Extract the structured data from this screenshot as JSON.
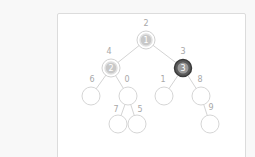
{
  "tree": {
    "nodes": [
      {
        "id": "root",
        "x": 146,
        "y": 40,
        "label": "2",
        "value": "1",
        "state": "visited"
      },
      {
        "id": "left",
        "x": 111,
        "y": 68,
        "label": "4",
        "value": "2",
        "state": "visited"
      },
      {
        "id": "right",
        "x": 183,
        "y": 68,
        "label": "3",
        "value": "3",
        "state": "current"
      },
      {
        "id": "ll",
        "x": 91,
        "y": 96,
        "label": "6",
        "value": "",
        "state": "empty"
      },
      {
        "id": "lr",
        "x": 128,
        "y": 96,
        "label": "0",
        "value": "",
        "state": "empty"
      },
      {
        "id": "rl",
        "x": 164,
        "y": 96,
        "label": "1",
        "value": "",
        "state": "empty"
      },
      {
        "id": "rr",
        "x": 201,
        "y": 96,
        "label": "8",
        "value": "",
        "state": "empty"
      },
      {
        "id": "lrl",
        "x": 118,
        "y": 124,
        "label": "7",
        "value": "",
        "state": "empty"
      },
      {
        "id": "lrr",
        "x": 137,
        "y": 124,
        "label": "5",
        "value": "",
        "state": "empty"
      },
      {
        "id": "rrr",
        "x": 210,
        "y": 124,
        "label": "9",
        "value": "",
        "state": "empty"
      }
    ],
    "edges": [
      [
        "root",
        "left"
      ],
      [
        "root",
        "right"
      ],
      [
        "left",
        "ll"
      ],
      [
        "left",
        "lr"
      ],
      [
        "right",
        "rl"
      ],
      [
        "right",
        "rr"
      ],
      [
        "lr",
        "lrl"
      ],
      [
        "lr",
        "lrr"
      ],
      [
        "rr",
        "rrr"
      ]
    ]
  },
  "labels": {
    "root": "2",
    "left": "4",
    "right": "3",
    "ll": "6",
    "lr": "0",
    "rl": "1",
    "rr": "8",
    "lrl": "7",
    "lrr": "5",
    "rrr": "9"
  },
  "values": {
    "root": "1",
    "left": "2",
    "right": "3"
  },
  "colors": {
    "panel_bg": "#ffffff",
    "page_bg": "#f8f8f8",
    "edge": "#d4d4d4",
    "visited_node": "#c8c8c8",
    "current_node": "#5a5a5a",
    "label_text": "#a8a8a8"
  }
}
